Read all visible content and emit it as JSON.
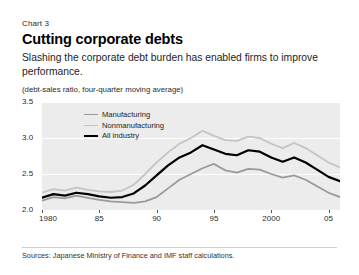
{
  "header": {
    "chart_label": "Chart 3",
    "title": "Cutting corporate debts",
    "subtitle": "Slashing the corporate debt burden has enabled firms to improve performance.",
    "unit_note": "(debt-sales ratio, four-quarter moving average)"
  },
  "footer": {
    "source": "Sources: Japanese Ministry of Finance and IMF staff calculations."
  },
  "colors": {
    "manufacturing": "#9a9a9a",
    "nonmanufacturing": "#c4c4c4",
    "all_industry": "#000000",
    "plot_background": "#ececed",
    "gridline": "#ffffff"
  },
  "chart_data": {
    "type": "line",
    "title": "Cutting corporate debts",
    "subtitle": "Slashing the corporate debt burden has enabled firms to improve performance.",
    "xlabel": "",
    "ylabel": "(debt-sales ratio, four-quarter moving average)",
    "ylim": [
      2.0,
      3.5
    ],
    "yticks": [
      2.0,
      2.5,
      3.0,
      3.5
    ],
    "ytick_labels": [
      "2.0",
      "2.5",
      "3.0",
      "3.5"
    ],
    "xlim": [
      1980,
      2006
    ],
    "xticks": [
      1980,
      1985,
      1990,
      1995,
      2000,
      2005
    ],
    "xtick_labels": [
      "1980",
      "85",
      "90",
      "95",
      "2000",
      "05"
    ],
    "grid": true,
    "legend_position": "upper-left-inside",
    "x": [
      1980,
      1981,
      1982,
      1983,
      1984,
      1985,
      1986,
      1987,
      1988,
      1989,
      1990,
      1991,
      1992,
      1993,
      1994,
      1995,
      1996,
      1997,
      1998,
      1999,
      2000,
      2001,
      2002,
      2003,
      2004,
      2005,
      2006
    ],
    "series": [
      {
        "name": "Manufacturing",
        "color": "#9a9a9a",
        "values": [
          2.13,
          2.18,
          2.16,
          2.2,
          2.17,
          2.14,
          2.12,
          2.11,
          2.1,
          2.12,
          2.18,
          2.3,
          2.42,
          2.5,
          2.58,
          2.64,
          2.55,
          2.52,
          2.57,
          2.56,
          2.5,
          2.45,
          2.48,
          2.42,
          2.33,
          2.24,
          2.18
        ]
      },
      {
        "name": "Nonmanufacturing",
        "color": "#c4c4c4",
        "values": [
          2.24,
          2.29,
          2.27,
          2.31,
          2.28,
          2.26,
          2.25,
          2.27,
          2.35,
          2.5,
          2.66,
          2.8,
          2.92,
          3.0,
          3.1,
          3.03,
          2.97,
          2.96,
          3.02,
          3.0,
          2.92,
          2.86,
          2.93,
          2.86,
          2.76,
          2.66,
          2.59
        ]
      },
      {
        "name": "All industry",
        "color": "#000000",
        "values": [
          2.17,
          2.22,
          2.2,
          2.24,
          2.22,
          2.19,
          2.17,
          2.18,
          2.23,
          2.34,
          2.48,
          2.62,
          2.73,
          2.8,
          2.9,
          2.84,
          2.78,
          2.76,
          2.83,
          2.81,
          2.73,
          2.67,
          2.73,
          2.66,
          2.56,
          2.46,
          2.4
        ]
      }
    ]
  }
}
